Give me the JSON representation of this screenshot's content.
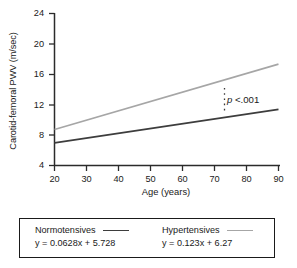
{
  "chart_data": {
    "type": "line",
    "title": "",
    "xlabel": "Age (years)",
    "ylabel": "Carotid-femoral PWV (m/sec)",
    "xlim": [
      20,
      90
    ],
    "ylim": [
      4,
      24
    ],
    "xticks": [
      20,
      30,
      40,
      50,
      60,
      70,
      80,
      90
    ],
    "yticks": [
      4,
      8,
      12,
      16,
      20,
      24
    ],
    "grid": false,
    "legend_position": "below-plot",
    "series": [
      {
        "name": "Normotensives",
        "equation": "y = 0.0628x + 5.728",
        "slope": 0.0628,
        "intercept": 5.728,
        "color": "#3d3d3d",
        "x": [
          20,
          90
        ],
        "values": [
          6.98,
          11.38
        ]
      },
      {
        "name": "Hypertensives",
        "equation": "y = 0.123x + 6.27",
        "slope": 0.123,
        "intercept": 6.27,
        "color": "#a6a6a6",
        "x": [
          20,
          90
        ],
        "values": [
          8.73,
          17.34
        ]
      }
    ],
    "annotations": [
      {
        "text": "p <.001",
        "italic_part": "p",
        "rest": " <.001",
        "at_x": 77,
        "marker": "dotted-vertical-bracket"
      }
    ]
  },
  "axes": {
    "y_title": "Carotid-femoral PWV (m/sec)",
    "x_title": "Age (years)",
    "y_tick_labels": [
      "24",
      "20",
      "16",
      "12",
      "8",
      "4"
    ],
    "x_tick_labels": [
      "20",
      "30",
      "40",
      "50",
      "60",
      "70",
      "80",
      "90"
    ]
  },
  "annotation": {
    "p_symbol": "p",
    "p_value_text": " <.001"
  },
  "legend": {
    "entries": [
      {
        "name": "Normotensives",
        "equation": "y = 0.0628x + 5.728"
      },
      {
        "name": "Hypertensives",
        "equation": "y = 0.123x + 6.27"
      }
    ]
  }
}
